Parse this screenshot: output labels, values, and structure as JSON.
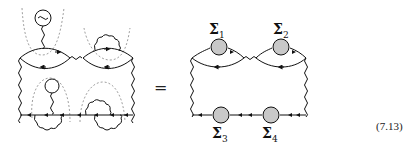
{
  "equation": {
    "equals_sign": "=",
    "number": "(7.13)"
  },
  "left_diagram": {
    "description": "Feynman diagram with fermion loops, wavy photon lines and dashed cut lines (self-energy insertions)",
    "elements": [
      "fermion-bubble-top-left",
      "fermion-bubble-top-right",
      "tadpole-loop-top",
      "tadpole-loop-middle",
      "wavy-rungs",
      "dashed-cuts",
      "bottom-fermion-line"
    ]
  },
  "right_diagram": {
    "description": "Skeleton diagram with self-energy blobs",
    "self_energies": [
      {
        "symbol": "Σ",
        "index": "1"
      },
      {
        "symbol": "Σ",
        "index": "2"
      },
      {
        "symbol": "Σ",
        "index": "3"
      },
      {
        "symbol": "Σ",
        "index": "4"
      }
    ],
    "blob_color": "#c8c8c8"
  }
}
